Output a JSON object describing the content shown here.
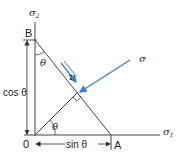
{
  "diagram": {
    "axes": {
      "vertical_label": "σ",
      "vertical_sub": "2",
      "horizontal_label": "σ",
      "horizontal_sub": "1"
    },
    "points": {
      "B": "B",
      "A": "A",
      "O": "0"
    },
    "angles": {
      "at_B": "θ",
      "at_O": "θ"
    },
    "dimensions": {
      "vertical": "cos θ",
      "horizontal": "sin θ"
    },
    "stresses": {
      "normal": "σ",
      "shear": "τ"
    },
    "colors": {
      "line": "#333333",
      "stress_arrow": "#3a7fd5"
    }
  }
}
